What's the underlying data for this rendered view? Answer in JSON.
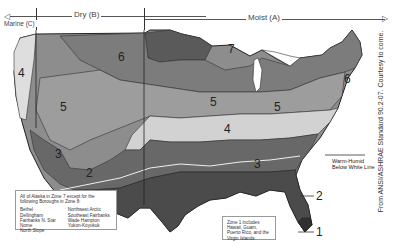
{
  "header": {
    "marine_label": "Marine (C)",
    "dry_label": "Dry (B)",
    "moist_label": "Moist (A)"
  },
  "zones": {
    "z1": "1",
    "z2a": "2",
    "z2b": "2",
    "z3a": "3",
    "z3b": "3",
    "z4a": "4",
    "z4b": "4",
    "z5a": "5",
    "z5b": "5",
    "z5c": "5",
    "z6a": "6",
    "z6b": "6",
    "z7": "7"
  },
  "alaska_note": {
    "intro": "All of Alaska in Zone 7 except for the following Boroughs in Zone 8:",
    "col1": [
      "Bethel",
      "Dellingham",
      "Fairbanks N. Star",
      "Nome",
      "North Slope"
    ],
    "col2": [
      "Northwest Arctic",
      "Southeast Fairbanks",
      "Wade Hampton",
      "Yukon-Koyukuk"
    ]
  },
  "zone1_note": {
    "text": "Zone 1 includes Hawaii, Guam, Puerto Rico, and the Virgin Islands"
  },
  "warm_humid": {
    "line1": "Warm-Humid",
    "line2": "Below White Line"
  },
  "credit": "From ANSI/ASHRAE Standard 90.2-07. Courtesy to come.",
  "colors": {
    "zone1": "#3a3a3a",
    "zone2": "#4a4a4a",
    "zone3": "#666666",
    "zone4": "#cfcfcf",
    "zone5": "#9a9a9a",
    "zone6": "#7a7a7a",
    "zone7": "#555555",
    "marine": "#d8d8d8"
  }
}
